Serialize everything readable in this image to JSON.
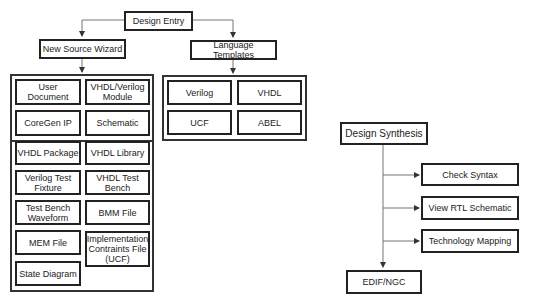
{
  "design_entry": {
    "title": "Design Entry",
    "new_source_wizard": {
      "title": "New Source Wizard",
      "items": [
        "User Document",
        "VHDL/Verilog Module",
        "CoreGen IP",
        "Schematic",
        "VHDL Package",
        "VHDL Library",
        "Verilog Test Fixture",
        "VHDL Test Bench",
        "Test Bench Waveform",
        "BMM File",
        "MEM File",
        "Implementation Contraints File (UCF)",
        "State Diagram"
      ]
    },
    "language_templates": {
      "title": "Language Templates",
      "items": [
        "Verilog",
        "VHDL",
        "UCF",
        "ABEL"
      ]
    }
  },
  "design_synthesis": {
    "title": "Design Synthesis",
    "steps": [
      "Check Syntax",
      "View RTL Schematic",
      "Technology Mapping"
    ],
    "output": "EDIF/NGC"
  }
}
